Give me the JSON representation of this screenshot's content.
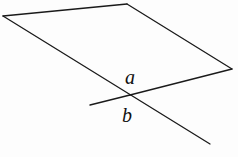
{
  "diagram": {
    "type": "geometry",
    "colors": {
      "stroke": "#1a1a1a",
      "background": "#fdfdfd"
    },
    "plane": {
      "points": [
        [
          3,
          16
        ],
        [
          127,
          4
        ],
        [
          232,
          69
        ],
        [
          130,
          95
        ]
      ]
    },
    "line_a": {
      "from": [
        130,
        95
      ],
      "to": [
        232,
        69
      ],
      "label": "a"
    },
    "line_b": {
      "from": [
        90,
        105
      ],
      "to": [
        130,
        95
      ],
      "label": "b"
    },
    "diagonal": {
      "from": [
        3,
        16
      ],
      "to": [
        210,
        144
      ]
    },
    "labels": {
      "a": "a",
      "b": "b"
    }
  }
}
